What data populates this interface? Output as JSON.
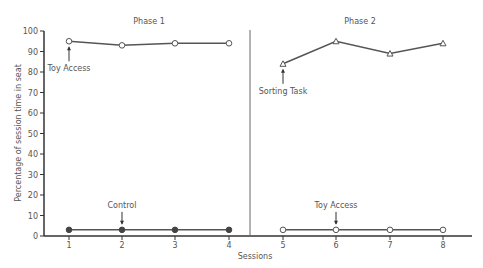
{
  "chart_data": {
    "type": "line",
    "title": "",
    "xlabel": "Sessions",
    "ylabel": "Percentage of session time in seat",
    "ylim": [
      0,
      100
    ],
    "yticks": [
      0,
      10,
      20,
      30,
      40,
      50,
      60,
      70,
      80,
      90,
      100
    ],
    "x": [
      1,
      2,
      3,
      4,
      5,
      6,
      7,
      8
    ],
    "grid": false,
    "legend": "none",
    "phases": [
      {
        "label": "Phase 1",
        "sessions": [
          1,
          2,
          3,
          4
        ]
      },
      {
        "label": "Phase 2",
        "sessions": [
          5,
          6,
          7,
          8
        ]
      }
    ],
    "series": [
      {
        "name": "Toy Access (Phase 1)",
        "marker": "open-circle",
        "x": [
          1,
          2,
          3,
          4
        ],
        "values": [
          95,
          93,
          94,
          94
        ]
      },
      {
        "name": "Control",
        "marker": "filled-circle",
        "x": [
          1,
          2,
          3,
          4
        ],
        "values": [
          3,
          3,
          3,
          3
        ]
      },
      {
        "name": "Sorting Task",
        "marker": "open-triangle",
        "x": [
          5,
          6,
          7,
          8
        ],
        "values": [
          84,
          95,
          89,
          94
        ]
      },
      {
        "name": "Toy Access (Phase 2)",
        "marker": "open-circle",
        "x": [
          5,
          6,
          7,
          8
        ],
        "values": [
          3,
          3,
          3,
          3
        ]
      }
    ],
    "annotations": [
      {
        "text": "Toy Access",
        "session": 1,
        "target_series": 0,
        "position": "below"
      },
      {
        "text": "Control",
        "session": 2,
        "target_series": 1,
        "position": "above"
      },
      {
        "text": "Sorting Task",
        "session": 5,
        "target_series": 2,
        "position": "below"
      },
      {
        "text": "Toy Access",
        "session": 6,
        "target_series": 3,
        "position": "above"
      }
    ]
  },
  "labels": {
    "phase1": "Phase 1",
    "phase2": "Phase 2",
    "xlabel": "Sessions",
    "ylabel": "Percentage of session time in seat",
    "ann_toy_access_1": "Toy Access",
    "ann_control": "Control",
    "ann_sorting_task": "Sorting Task",
    "ann_toy_access_2": "Toy Access"
  }
}
